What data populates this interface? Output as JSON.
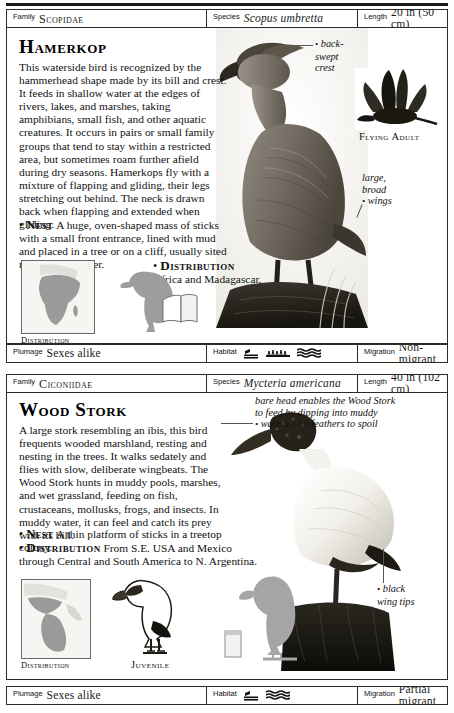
{
  "page": {
    "entries": [
      {
        "header": {
          "family_label": "Family",
          "family_value": "Scopidae",
          "species_label": "Species",
          "species_value": "Scopus umbretta",
          "length_label": "Length",
          "length_value": "20 in (50 cm)"
        },
        "title": "Hamerkop",
        "body": "This waterside bird is recognized by the hammerhead shape made by its bill and crest. It feeds in shallow water at the edges of rivers, lakes, and marshes, taking amphibians, small fish, and other aquatic creatures. It occurs in pairs or small family groups that tend to stay within a restricted area, but sometimes roam further afield during dry seasons. Hamerkops fly with a mixture of flapping and gliding, their legs stretching out behind. The neck is drawn back when flapping and extended when gliding.",
        "nest_label": "Nest",
        "nest_text": "A huge, oven-shaped mass of sticks with a small front entrance, lined with mud and placed in a tree or on a cliff, usually sited near or over water.",
        "distribution_label": "Distribution",
        "distribution_text": "Africa and Madagascar.",
        "map_caption": "Distribution",
        "annotations": [
          {
            "name": "back-swept-crest",
            "lines": [
              "back-",
              "swept",
              "crest"
            ]
          },
          {
            "name": "large-broad-wings",
            "lines": [
              "large,",
              "broad",
              "wings"
            ]
          }
        ],
        "figure_caption": "Flying Adult",
        "footer": {
          "plumage_label": "Plumage",
          "plumage_value": "Sexes alike",
          "habitat_label": "Habitat",
          "habitat_icons": [
            "reeds-icon",
            "shore-icon",
            "water-icon"
          ],
          "migration_label": "Migration",
          "migration_value": "Non-migrant"
        }
      },
      {
        "header": {
          "family_label": "Family",
          "family_value": "Ciconiidae",
          "species_label": "Species",
          "species_value": "Mycteria americana",
          "length_label": "Length",
          "length_value": "40 in (102 cm)"
        },
        "title": "Wood Stork",
        "body": "A large stork resembling an ibis, this bird frequents wooded marshland, resting and nesting in the trees. It walks sedately and flies with slow, deliberate wingbeats. The Wood Stork hunts in muddy pools, marshes, and wet grassland, feeding on fish, crustaceans, mollusks, frogs, and insects. In muddy water, it can feel and catch its prey with its bill.",
        "nest_label": "Nest",
        "nest_text": "A thin platform of sticks in a treetop colony.",
        "distribution_label": "Distribution",
        "distribution_text": "From S.E. USA and Mexico through Central and South America to N. Argentina.",
        "map_caption": "Distribution",
        "annotations": [
          {
            "name": "bare-head-note",
            "lines": [
              "bare head enables the Wood Stork",
              "to feed by dipping into muddy",
              "waters – no feathers to spoil"
            ]
          },
          {
            "name": "black-wing-tips",
            "lines": [
              "black",
              "wing tips"
            ]
          }
        ],
        "figure_caption": "Juvenile",
        "footer": {
          "plumage_label": "Plumage",
          "plumage_value": "Sexes alike",
          "habitat_label": "Habitat",
          "habitat_icons": [
            "reeds-icon",
            "water-icon"
          ],
          "migration_label": "Migration",
          "migration_value": "Partial migrant"
        }
      }
    ]
  }
}
